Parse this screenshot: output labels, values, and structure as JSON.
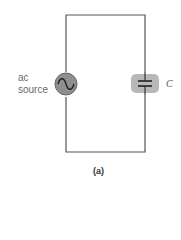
{
  "diagram": {
    "type": "circuit",
    "source_label_line1": "ac",
    "source_label_line2": "source",
    "capacitor_label": "C",
    "figure_label": "(a)",
    "components": [
      {
        "name": "ac source",
        "position": "left branch",
        "symbol": "sine-wave-in-circle"
      },
      {
        "name": "capacitor",
        "label": "C",
        "position": "right branch",
        "symbol": "parallel-plates"
      }
    ],
    "colors": {
      "wire": "#555555",
      "source_fill": "#8a8a8a",
      "capacitor_highlight": "#b5b5b5",
      "label_text": "#6a6a6a"
    }
  }
}
